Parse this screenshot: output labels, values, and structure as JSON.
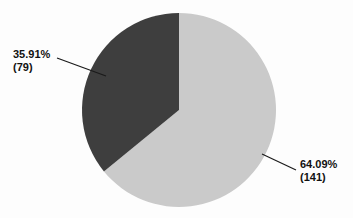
{
  "chart_data": {
    "type": "pie",
    "title": "",
    "subtitle": "",
    "xlabel": "",
    "ylabel": "",
    "legend_position": "none",
    "grid": false,
    "total": 220,
    "start_angle_deg": 0,
    "direction": "clockwise",
    "categories": [
      "Light gray slice",
      "Dark gray slice"
    ],
    "values": [
      141,
      79
    ],
    "percentages": [
      64.09,
      35.91
    ],
    "slices": [
      {
        "name": "Light gray slice",
        "value": 141,
        "percent": 64.09,
        "percent_label": "64.09%",
        "count_label": "(141)",
        "color": "#cacaca",
        "start_angle_deg": 0,
        "end_angle_deg": 230.72,
        "label_position": "right"
      },
      {
        "name": "Dark gray slice",
        "value": 79,
        "percent": 35.91,
        "percent_label": "35.91%",
        "count_label": "(79)",
        "color": "#3e3e3e",
        "start_angle_deg": 230.72,
        "end_angle_deg": 360,
        "label_position": "left"
      }
    ],
    "annotations": [
      {
        "name": "dark-slice-callout",
        "percent_label": "35.91%",
        "count_label": "(79)",
        "leader_from": [
          57,
          58
        ],
        "leader_to": [
          106,
          76
        ]
      },
      {
        "name": "light-slice-callout",
        "percent_label": "64.09%",
        "count_label": "(141)",
        "leader_from": [
          262,
          154
        ],
        "leader_to": [
          296,
          170
        ]
      }
    ]
  },
  "geometry": {
    "center_x": 179,
    "center_y": 110,
    "radius": 97
  },
  "colors": {
    "background": "#fdfdfd",
    "slice_light": "#cacaca",
    "slice_dark": "#3e3e3e",
    "leader_line": "#1a1a1a",
    "label_text": "#111111"
  },
  "labels": {
    "dark": {
      "percent": "35.91%",
      "count": "(79)"
    },
    "light": {
      "percent": "64.09%",
      "count": "(141)"
    }
  }
}
